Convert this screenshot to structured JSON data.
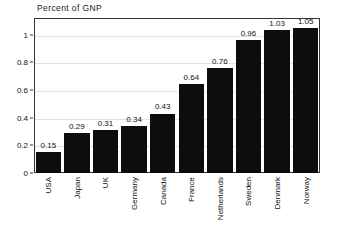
{
  "chart_data": {
    "type": "bar",
    "title": "Percent of GNP",
    "xlabel": "",
    "ylabel": "",
    "categories": [
      "USA",
      "Japan",
      "UK",
      "Germany",
      "Canada",
      "France",
      "Netherlands",
      "Sweden",
      "Denmark",
      "Norway"
    ],
    "values": [
      0.15,
      0.29,
      0.31,
      0.34,
      0.43,
      0.64,
      0.76,
      0.96,
      1.03,
      1.05
    ],
    "value_labels": [
      "0.15",
      "0.29",
      "0.31",
      "0.34",
      "0.43",
      "0.64",
      "0.76",
      "0.96",
      "1.03",
      "1.05"
    ],
    "ylim": [
      0,
      1.12
    ],
    "y_ticks": [
      0,
      0.2,
      0.4,
      0.6,
      0.8,
      1
    ],
    "y_tick_labels": [
      "0",
      "0.2",
      "0.4",
      "0.6",
      "0.8",
      "1"
    ],
    "grid": true,
    "legend": false,
    "bar_color": "#0d0d0d",
    "grid_color": "#e2e2e2",
    "frame_color": "#333333",
    "background": "#ffffff"
  }
}
